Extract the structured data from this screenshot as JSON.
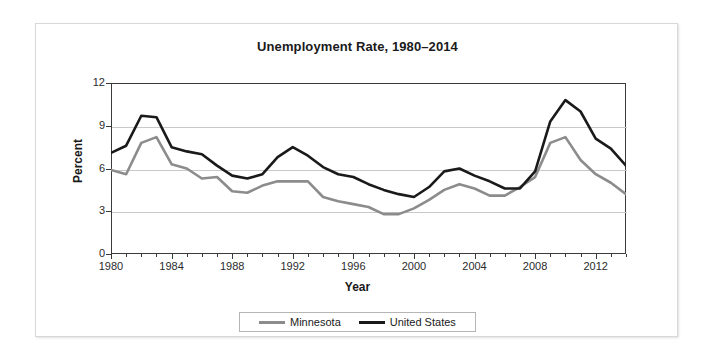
{
  "chart_data": {
    "type": "line",
    "title": "Unemployment Rate, 1980–2014",
    "xlabel": "Year",
    "ylabel": "Percent",
    "xlim": [
      1980,
      2014
    ],
    "ylim": [
      0,
      12
    ],
    "yticks": [
      0,
      3,
      6,
      9,
      12
    ],
    "xticks": [
      1980,
      1984,
      1988,
      1992,
      1996,
      2000,
      2004,
      2008,
      2012
    ],
    "grid": true,
    "legend_position": "bottom",
    "x": [
      1980,
      1981,
      1982,
      1983,
      1984,
      1985,
      1986,
      1987,
      1988,
      1989,
      1990,
      1991,
      1992,
      1993,
      1994,
      1995,
      1996,
      1997,
      1998,
      1999,
      2000,
      2001,
      2002,
      2003,
      2004,
      2005,
      2006,
      2007,
      2008,
      2009,
      2010,
      2011,
      2012,
      2013,
      2014
    ],
    "series": [
      {
        "name": "Minnesota",
        "color": "#8c8c8c",
        "values": [
          5.9,
          5.6,
          7.8,
          8.2,
          6.3,
          6.0,
          5.3,
          5.4,
          4.4,
          4.3,
          4.8,
          5.1,
          5.1,
          5.1,
          4.0,
          3.7,
          3.5,
          3.3,
          2.8,
          2.8,
          3.2,
          3.8,
          4.5,
          4.9,
          4.6,
          4.1,
          4.1,
          4.7,
          5.4,
          7.8,
          8.2,
          6.6,
          5.6,
          5.0,
          4.2
        ]
      },
      {
        "name": "United States",
        "color": "#1a1a1a",
        "values": [
          7.1,
          7.6,
          9.7,
          9.6,
          7.5,
          7.2,
          7.0,
          6.2,
          5.5,
          5.3,
          5.6,
          6.8,
          7.5,
          6.9,
          6.1,
          5.6,
          5.4,
          4.9,
          4.5,
          4.2,
          4.0,
          4.7,
          5.8,
          6.0,
          5.5,
          5.1,
          4.6,
          4.6,
          5.8,
          9.3,
          10.8,
          10.0,
          8.1,
          7.4,
          6.2
        ]
      }
    ]
  },
  "legend": {
    "items": [
      {
        "label": "Minnesota"
      },
      {
        "label": "United States"
      }
    ]
  }
}
